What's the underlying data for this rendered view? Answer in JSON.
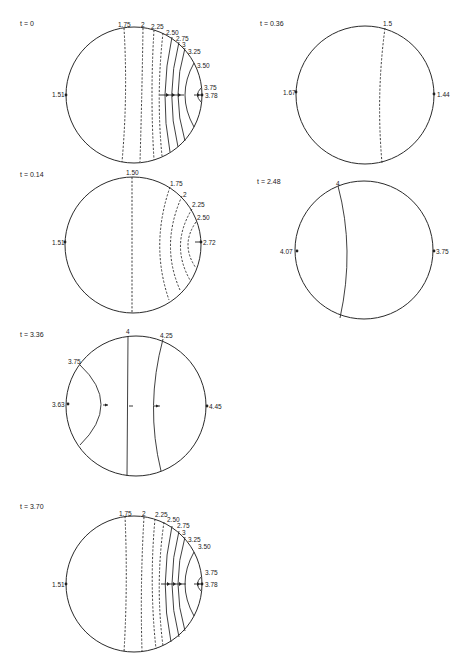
{
  "figure": {
    "panels": [
      {
        "id": "p1",
        "time_label": "t = 0",
        "left_value": "1.51",
        "right_value": "3.78",
        "contours": [
          "1.75",
          "2",
          "2.25",
          "2.50",
          "2.75",
          "3",
          "3.25",
          "3.50",
          "3.75"
        ]
      },
      {
        "id": "p2",
        "time_label": "t = 0.36",
        "left_value": "1.67",
        "right_value": "1.44",
        "contours": [
          "1.5"
        ]
      },
      {
        "id": "p3",
        "time_label": "t = 0.14",
        "left_value": "1.51",
        "right_value": "2.72",
        "contours": [
          "1.50",
          "1.75",
          "2",
          "2.25",
          "2.50"
        ]
      },
      {
        "id": "p4",
        "time_label": "t = 2.48",
        "left_value": "4.07",
        "right_value": "3.75",
        "contours": [
          "4"
        ]
      },
      {
        "id": "p5",
        "time_label": "t = 3.36",
        "left_value": "3.63",
        "right_value": "4.45",
        "contours": [
          "3.75",
          "4",
          "4.25"
        ]
      },
      {
        "id": "p6",
        "time_label": "t = 3.70",
        "left_value": "1.51",
        "right_value": "3.78",
        "contours": [
          "1.75",
          "2",
          "2.25",
          "2.50",
          "2.75",
          "3",
          "3.25",
          "3.50",
          "3.75"
        ]
      }
    ]
  }
}
